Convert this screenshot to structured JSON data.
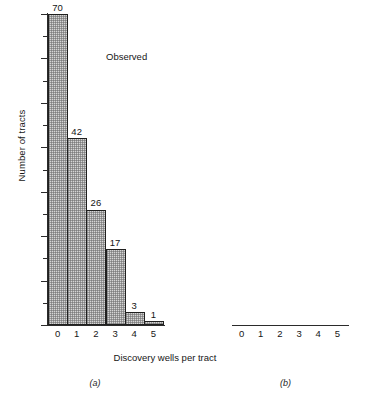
{
  "figure": {
    "ylabel": "Number of tracts",
    "xlabel": "Discovery wells per tract",
    "ytick_labels": [
      "0",
      "10",
      "20",
      "30",
      "40",
      "50",
      "60",
      "70"
    ],
    "xtick_labels": [
      "0",
      "1",
      "2",
      "3",
      "4",
      "5"
    ],
    "panel_captions": {
      "a": "(a)",
      "b": "(b)"
    },
    "series_labels": {
      "a": "Observed",
      "b": "Negative binomial"
    }
  },
  "chart_data": [
    {
      "type": "bar",
      "title": "Observed",
      "panel": "(a)",
      "categories": [
        "0",
        "1",
        "2",
        "3",
        "4",
        "5"
      ],
      "values": [
        70,
        42,
        26,
        17,
        3,
        1
      ],
      "labels": [
        "70",
        "42",
        "26",
        "17",
        "3",
        "1"
      ],
      "xlabel": "Discovery wells per tract",
      "ylabel": "Number of tracts",
      "ylim": [
        0,
        70
      ],
      "ytick_values": [
        0,
        10,
        20,
        30,
        40,
        50,
        60,
        70
      ],
      "yminor_tick_values": [
        5,
        15,
        25,
        35,
        45,
        55,
        65
      ],
      "grid": false,
      "legend": "none",
      "bar_fill": "#d5d5d5",
      "bar_edge": "#20201f"
    },
    {
      "type": "bar",
      "title": "Negative binomial",
      "panel": "(b)",
      "categories": [
        "0",
        "1",
        "2",
        "3",
        "4",
        "5"
      ],
      "values": [
        70.2,
        48.2,
        24.2,
        10.6,
        4.3,
        1.6
      ],
      "labels": [
        "70.2",
        "48.2",
        "24.2",
        "10.6",
        "4.3",
        "1.6"
      ],
      "xlabel": "Discovery wells per tract",
      "ylabel": "Number of tracts",
      "ylim": [
        0,
        70
      ],
      "ytick_values": [
        0,
        10,
        20,
        30,
        40,
        50,
        60,
        70
      ],
      "yminor_tick_values": [
        5,
        15,
        25,
        35,
        45,
        55,
        65
      ],
      "grid": false,
      "legend": "none",
      "bar_fill": "#d5d5d5",
      "bar_edge": "#20201f"
    }
  ]
}
